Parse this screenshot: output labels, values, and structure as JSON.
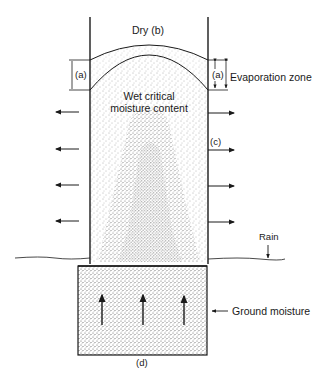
{
  "diagram": {
    "labels": {
      "dry": "Dry (b)",
      "a_left": "(a)",
      "a_right": "(a)",
      "evaporation_zone": "Evaporation zone",
      "wet_line1": "Wet critical",
      "wet_line2": "moisture content",
      "c": "(c)",
      "rain": "Rain",
      "ground_moisture": "Ground moisture",
      "d": "(d)"
    },
    "colors": {
      "line": "#1a1a1a",
      "stipple": "#555555",
      "background": "#ffffff"
    }
  }
}
